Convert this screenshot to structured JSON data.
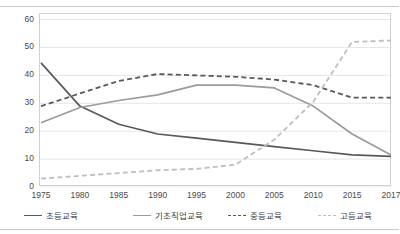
{
  "chart_data": {
    "type": "line",
    "title": "",
    "xlabel": "",
    "ylabel": "",
    "x": [
      1975,
      1980,
      1985,
      1990,
      1995,
      2000,
      2005,
      2010,
      2015,
      2017
    ],
    "xtick_labels": [
      "1975",
      "1980",
      "1985",
      "1990",
      "1995",
      "2000",
      "2005",
      "2010",
      "2015",
      "2017"
    ],
    "ytick_labels": [
      "0",
      "10",
      "20",
      "30",
      "40",
      "50",
      "60"
    ],
    "yticks": [
      0,
      10,
      20,
      30,
      40,
      50,
      60
    ],
    "ylim": [
      0,
      62
    ],
    "grid": "horizontal",
    "legend_position": "bottom",
    "series": [
      {
        "name": "초등교육",
        "color": "#595959",
        "style": "solid",
        "values": [
          44.5,
          29.0,
          22.5,
          19.0,
          17.5,
          16.0,
          14.5,
          13.0,
          11.5,
          11.0
        ]
      },
      {
        "name": "기초직업교육",
        "color": "#9b9b9b",
        "style": "solid",
        "values": [
          23.0,
          28.5,
          31.0,
          33.0,
          36.5,
          36.5,
          35.5,
          29.0,
          19.0,
          11.5
        ]
      },
      {
        "name": "중등교육",
        "color": "#595959",
        "style": "dashed",
        "values": [
          29.0,
          33.5,
          38.0,
          40.5,
          40.0,
          39.5,
          38.5,
          36.5,
          32.0,
          32.0
        ]
      },
      {
        "name": "고등교육",
        "color": "#bfbfbf",
        "style": "dashed",
        "values": [
          3.0,
          4.0,
          5.0,
          6.0,
          6.5,
          8.0,
          17.0,
          30.5,
          52.0,
          52.5
        ]
      }
    ]
  },
  "legend": {
    "items": [
      {
        "label": "초등교육"
      },
      {
        "label": "기초직업교육"
      },
      {
        "label": "중등교육"
      },
      {
        "label": "고등교육"
      }
    ]
  }
}
